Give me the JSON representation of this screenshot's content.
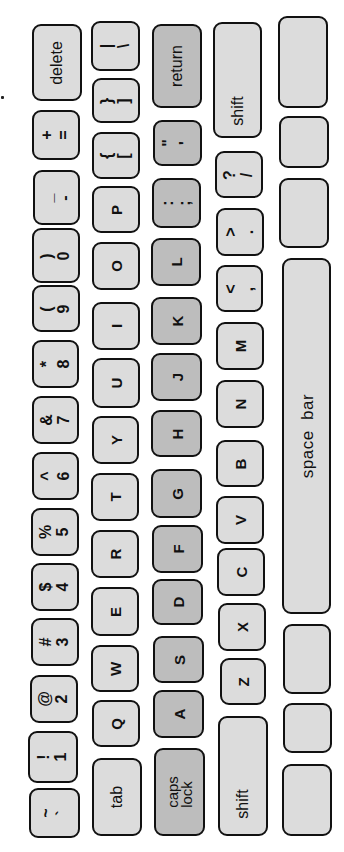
{
  "orientation": "keyboard rotated 90deg counter-clockwise",
  "colors": {
    "background": "#ffffff",
    "key_fill": "#dcdcdc",
    "home_key_fill": "#bdbdbd",
    "key_border": "#111111"
  },
  "rows": {
    "number_row": [
      {
        "top": "+",
        "bottom": "="
      },
      {
        "top": "_",
        "bottom": "-"
      },
      {
        "top": ")",
        "bottom": "0"
      },
      {
        "top": "(",
        "bottom": "9"
      },
      {
        "top": "*",
        "bottom": "8"
      },
      {
        "top": "&",
        "bottom": "7"
      },
      {
        "top": "^",
        "bottom": "6"
      },
      {
        "top": "%",
        "bottom": "5"
      },
      {
        "top": "$",
        "bottom": "4"
      },
      {
        "top": "#",
        "bottom": "3"
      },
      {
        "top": "@",
        "bottom": "2"
      },
      {
        "top": "!",
        "bottom": "1"
      },
      {
        "top": "~",
        "bottom": "`"
      }
    ],
    "delete_label": "delete",
    "qwerty_row": {
      "backslash": {
        "top": "|",
        "bottom": "\\"
      },
      "close_bracket": {
        "top": "}",
        "bottom": "]"
      },
      "open_bracket": {
        "top": "{",
        "bottom": "["
      },
      "letters": [
        "P",
        "O",
        "I",
        "U",
        "Y",
        "T",
        "R",
        "E",
        "W",
        "Q"
      ],
      "tab_label": "tab"
    },
    "home_row": {
      "return_label": "return",
      "quote": {
        "top": "\"",
        "bottom": "'"
      },
      "semicolon": {
        "top": ":",
        "bottom": ";"
      },
      "letters": [
        "L",
        "K",
        "J",
        "H",
        "G",
        "F",
        "D",
        "S",
        "A"
      ],
      "caps_lock_label": "caps\nlock"
    },
    "shift_row": {
      "right_shift_label": "shift",
      "slash": {
        "top": "?",
        "bottom": "/"
      },
      "period": {
        "top": ">",
        "bottom": "."
      },
      "comma": {
        "top": "<",
        "bottom": ","
      },
      "letters": [
        "M",
        "N",
        "B",
        "V",
        "C",
        "X",
        "Z"
      ],
      "left_shift_label": "shift"
    },
    "bottom_row": {
      "space_bar_label": "space  bar"
    }
  }
}
